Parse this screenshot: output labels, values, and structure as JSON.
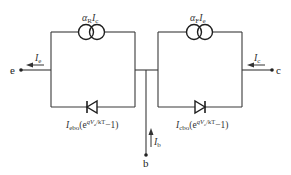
{
  "diagram": {
    "title": "",
    "colors": {
      "line": "#3a3a3a",
      "text": "#333333",
      "background": "#ffffff"
    },
    "sources": [
      {
        "id": "reverse-source",
        "label_main": "α",
        "label_sub": "R",
        "label_main2": "I",
        "label_sub2": "c"
      },
      {
        "id": "forward-source",
        "label_main": "α",
        "label_sub": "F",
        "label_main2": "I",
        "label_sub2": "e"
      }
    ],
    "diodes": [
      {
        "id": "emitter-diode",
        "direction": "left",
        "label_I": "I",
        "label_I_sub": "ebo",
        "label_paren_open": "(e",
        "label_exp": "qV",
        "label_exp_sub": "e",
        "label_exp_rest": "/kT",
        "label_tail": "−1)"
      },
      {
        "id": "collector-diode",
        "direction": "right",
        "label_I": "I",
        "label_I_sub": "cbo",
        "label_paren_open": "(e",
        "label_exp": "qV",
        "label_exp_sub": "c",
        "label_exp_rest": "/kT",
        "label_tail": "−1)"
      }
    ],
    "terminals": {
      "emitter": {
        "label": "e"
      },
      "collector": {
        "label": "c"
      },
      "base": {
        "label": "b"
      }
    },
    "currents": {
      "emitter": {
        "main": "I",
        "sub": "e"
      },
      "collector": {
        "main": "I",
        "sub": "c"
      },
      "base": {
        "main": "I",
        "sub": "b"
      }
    }
  }
}
